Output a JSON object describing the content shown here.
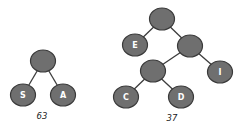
{
  "trees": [
    {
      "caption": "63",
      "caption_pos": [
        42,
        119
      ],
      "nodes": [
        {
          "id": "r",
          "label": "",
          "x": 43,
          "y": 61
        },
        {
          "id": "s",
          "label": "S",
          "x": 23,
          "y": 95
        },
        {
          "id": "a",
          "label": "A",
          "x": 63,
          "y": 95
        }
      ],
      "edges": [
        [
          "r",
          "s"
        ],
        [
          "r",
          "a"
        ]
      ]
    },
    {
      "caption": "37",
      "caption_pos": [
        172,
        121
      ],
      "nodes": [
        {
          "id": "r",
          "label": "",
          "x": 162,
          "y": 19
        },
        {
          "id": "e",
          "label": "E",
          "x": 135,
          "y": 45
        },
        {
          "id": "m",
          "label": "",
          "x": 190,
          "y": 46
        },
        {
          "id": "n",
          "label": "",
          "x": 153,
          "y": 71
        },
        {
          "id": "i",
          "label": "I",
          "x": 220,
          "y": 72
        },
        {
          "id": "c",
          "label": "C",
          "x": 126,
          "y": 97
        },
        {
          "id": "d",
          "label": "D",
          "x": 181,
          "y": 97
        }
      ],
      "edges": [
        [
          "r",
          "e"
        ],
        [
          "r",
          "m"
        ],
        [
          "m",
          "n"
        ],
        [
          "m",
          "i"
        ],
        [
          "n",
          "c"
        ],
        [
          "n",
          "d"
        ]
      ]
    }
  ],
  "style": {
    "node_fill": "#6f6f6f",
    "node_stroke": "#3a3a3a",
    "label_color": "#ffffff",
    "node_rx": 12.5,
    "node_ry": 11
  }
}
